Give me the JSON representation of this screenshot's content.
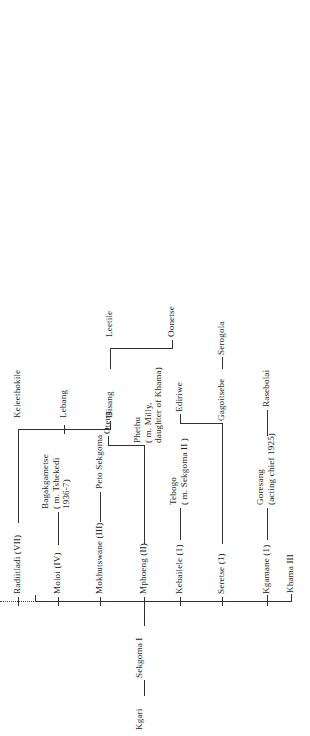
{
  "chart_title": "Genealogy of the Bangwato royal house",
  "root": {
    "name": "Kgari",
    "child": "Sekgoma I"
  },
  "generation_children": [
    {
      "id": "kgamane",
      "label": "Kgamane (1)"
    },
    {
      "id": "seretse",
      "label": "Seretse (1)"
    },
    {
      "id": "kebailele",
      "label": "Kebailele (1)"
    },
    {
      "id": "mphoeng",
      "label": "Mphoeng (II)"
    },
    {
      "id": "mokhutswane",
      "label": "Mokhutswane (III)"
    },
    {
      "id": "moloi",
      "label": "Moloi (IV)"
    },
    {
      "id": "radiitladi",
      "label": "Radiitladi (VII)"
    }
  ],
  "descendants": {
    "khama_iii": "Khama III",
    "goresang": "Goresang\n(acting chief 1925)",
    "rasebolai": "Rasebolai",
    "gagoitsebe": "Gagoitsebe",
    "serogola": "Serogola",
    "tebogo": "Tebogo\n( m. Sekgoma II )",
    "ediriwe": "Ediriwe",
    "phethu": "Phethu\n( m. Milly,\ndaughter of Khama)",
    "oteng": "Oteng",
    "peto_sekgoma": "Peto Sekgoma",
    "bagakgametse": "Bagakgametse\n( m. Tshekedi\n1936-7)",
    "disang": "Disang",
    "lebang": "Lebang",
    "keleethokile": "Keleethokile",
    "oonetse": "Oonetse",
    "leetile": "Leetile"
  },
  "style": {
    "line_color": "#303030",
    "text_color": "#1d1d1d",
    "background": "#ffffff"
  }
}
